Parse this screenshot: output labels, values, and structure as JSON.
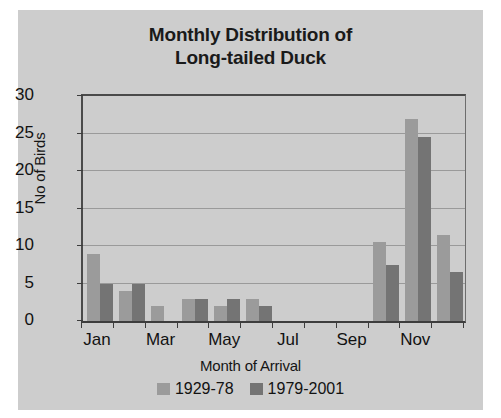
{
  "chart_data": {
    "type": "bar",
    "title": "Monthly Distribution of Long-tailed Duck",
    "title_line1": "Monthly Distribution of",
    "title_line2": "Long-tailed Duck",
    "xlabel": "Month of Arrival",
    "ylabel": "No of Birds",
    "categories": [
      "Jan",
      "Feb",
      "Mar",
      "Apr",
      "May",
      "Jun",
      "Jul",
      "Aug",
      "Sep",
      "Oct",
      "Nov",
      "Dec"
    ],
    "tick_labels": [
      "Jan",
      "",
      "Mar",
      "",
      "May",
      "",
      "Jul",
      "",
      "Sep",
      "",
      "Nov",
      ""
    ],
    "series": [
      {
        "name": "1929-78",
        "color": "#9b9b9b",
        "values": [
          9,
          4,
          2,
          3,
          2,
          3,
          0,
          0,
          0,
          10.5,
          27,
          11.5
        ]
      },
      {
        "name": "1979-2001",
        "color": "#747474",
        "values": [
          5,
          5,
          0,
          3,
          3,
          2,
          0,
          0,
          0,
          7.5,
          24.5,
          6.5
        ]
      }
    ],
    "ylim": [
      0,
      30
    ],
    "y_ticks": [
      0,
      5,
      10,
      15,
      20,
      25,
      30
    ],
    "y_tick_labels": [
      "0",
      "5",
      "10",
      "15",
      "20",
      "25",
      "30"
    ],
    "grid": true,
    "grid_axis": "y",
    "legend_position": "bottom",
    "background_color": "#cdcdcd",
    "axis_color": "#3d3d3d",
    "gridline_color": "#9a9a9a"
  },
  "legend": {
    "items": [
      {
        "label": "1929-78",
        "color": "#9b9b9b"
      },
      {
        "label": "1979-2001",
        "color": "#747474"
      }
    ]
  }
}
